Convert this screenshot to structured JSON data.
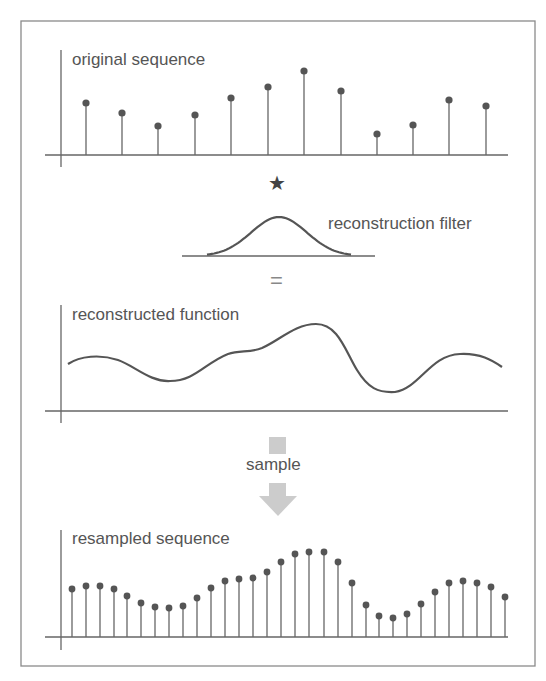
{
  "frame": {
    "x": 21,
    "y": 21,
    "width": 514,
    "height": 645,
    "stroke": "#8a8a8a"
  },
  "colors": {
    "ink": "#666666",
    "text": "#555555",
    "dot": "#555555",
    "arrow": "#cccccc"
  },
  "panels": {
    "original": {
      "label": "original sequence",
      "baseline_y": 155,
      "axis": {
        "x": 61,
        "top": 50,
        "bottom": 167,
        "line_left": 45,
        "line_right": 508
      },
      "stems": [
        {
          "x": 86,
          "y": 103
        },
        {
          "x": 122,
          "y": 113
        },
        {
          "x": 158,
          "y": 126
        },
        {
          "x": 195,
          "y": 115
        },
        {
          "x": 231,
          "y": 98
        },
        {
          "x": 268,
          "y": 87
        },
        {
          "x": 304,
          "y": 71
        },
        {
          "x": 341,
          "y": 91
        },
        {
          "x": 377,
          "y": 134
        },
        {
          "x": 413,
          "y": 125
        },
        {
          "x": 449,
          "y": 100
        },
        {
          "x": 486,
          "y": 106
        }
      ]
    },
    "operator": {
      "symbol": "★",
      "x": 276,
      "y": 183
    },
    "filter": {
      "label": "reconstruction filter",
      "baseline_y": 256,
      "line_left": 182,
      "line_right": 375,
      "center_x": 279,
      "peak_y": 217,
      "half_width": 72
    },
    "equals": {
      "symbol": "=",
      "x": 279,
      "y": 282
    },
    "reconstructed": {
      "label": "reconstructed function",
      "baseline_y": 411,
      "axis": {
        "x": 61,
        "top": 305,
        "bottom": 423,
        "line_left": 45,
        "line_right": 508
      },
      "curve": "M68,364 C80,356 100,354 118,360 C135,366 150,382 170,381 C195,381 205,363 228,354 C240,350 250,353 262,348 C280,340 295,324 316,324 C338,324 345,350 357,370 C368,388 378,393 395,392 C420,388 430,355 460,354 C480,353 492,360 502,367"
    },
    "sample_step": {
      "label": "sample",
      "arrow_square": {
        "x": 269,
        "y": 437,
        "size": 17
      },
      "arrow_shaft": {
        "x": 269,
        "y": 483,
        "width": 17,
        "height": 14
      },
      "arrow_head": {
        "tip_x": 278,
        "tip_y": 516,
        "half_width": 19,
        "top_y": 496
      }
    },
    "resampled": {
      "label": "resampled sequence",
      "baseline_y": 637,
      "axis": {
        "x": 61,
        "top": 530,
        "bottom": 650,
        "line_left": 45,
        "line_right": 508
      },
      "stems": [
        {
          "x": 72,
          "y": 589
        },
        {
          "x": 86,
          "y": 586
        },
        {
          "x": 100,
          "y": 586
        },
        {
          "x": 114,
          "y": 589
        },
        {
          "x": 127,
          "y": 596
        },
        {
          "x": 141,
          "y": 603
        },
        {
          "x": 155,
          "y": 607
        },
        {
          "x": 169,
          "y": 608
        },
        {
          "x": 183,
          "y": 606
        },
        {
          "x": 197,
          "y": 598
        },
        {
          "x": 211,
          "y": 588
        },
        {
          "x": 225,
          "y": 581
        },
        {
          "x": 239,
          "y": 579
        },
        {
          "x": 253,
          "y": 578
        },
        {
          "x": 267,
          "y": 572
        },
        {
          "x": 281,
          "y": 562
        },
        {
          "x": 295,
          "y": 554
        },
        {
          "x": 309,
          "y": 552
        },
        {
          "x": 324,
          "y": 552
        },
        {
          "x": 338,
          "y": 562
        },
        {
          "x": 352,
          "y": 583
        },
        {
          "x": 366,
          "y": 605
        },
        {
          "x": 379,
          "y": 616
        },
        {
          "x": 393,
          "y": 618
        },
        {
          "x": 407,
          "y": 614
        },
        {
          "x": 421,
          "y": 604
        },
        {
          "x": 435,
          "y": 592
        },
        {
          "x": 449,
          "y": 583
        },
        {
          "x": 463,
          "y": 581
        },
        {
          "x": 477,
          "y": 583
        },
        {
          "x": 491,
          "y": 587
        },
        {
          "x": 505,
          "y": 597
        }
      ]
    }
  }
}
